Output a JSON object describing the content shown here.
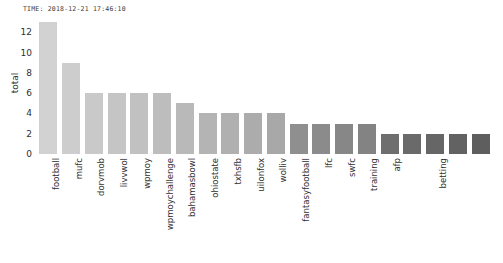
{
  "annotation": {
    "timestamp": "TIME: 2018-12-21 17:46:10"
  },
  "chart_data": {
    "type": "bar",
    "title": "",
    "xlabel": "",
    "ylabel": "total",
    "ylim": [
      0,
      13.5
    ],
    "yticks": [
      0,
      2,
      4,
      6,
      8,
      10,
      12
    ],
    "grid": false,
    "legend": null,
    "categories": [
      "football",
      "mufc",
      "dorvmob",
      "livvwol",
      "wpmoy",
      "wpmoychallenge",
      "bahamasbowl",
      "ohiostate",
      "txhsfb",
      "uilonfox",
      "wolliv",
      "fantasyfootball",
      "lfc",
      "swfc",
      "training",
      "afp",
      "",
      "betting",
      "",
      ""
    ],
    "values": [
      13,
      9,
      6,
      6,
      6,
      6,
      5,
      4,
      4,
      4,
      4,
      3,
      3,
      3,
      3,
      2,
      2,
      2,
      2,
      2
    ],
    "bar_colors": [
      "#d2d2d2",
      "#cdcdcd",
      "#c9c9c9",
      "#c5c5c5",
      "#c1c1c1",
      "#bdbdbd",
      "#b9b9b9",
      "#b4b4b4",
      "#b0b0b0",
      "#acacac",
      "#a8a8a8",
      "#8f8f8f",
      "#8b8b8b",
      "#878787",
      "#838383",
      "#6e6e6e",
      "#6a6a6a",
      "#666666",
      "#626262",
      "#5e5e5e"
    ]
  }
}
